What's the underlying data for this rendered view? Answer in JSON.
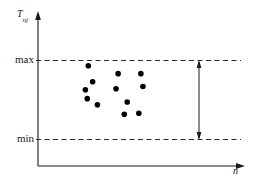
{
  "figure": {
    "background_color": "#ffffff",
    "ink_color": "#1a1a1a",
    "dot_color": "#000000"
  },
  "chart_data": {
    "type": "scatter",
    "title": "",
    "xlabel": "n",
    "ylabel": "T",
    "ylabel_subscript": "nj",
    "grid": false,
    "legend": null,
    "axis_arrows": true,
    "xlim": [
      0,
      1
    ],
    "ylim": [
      0,
      1
    ],
    "tick_labels": {
      "y": [
        "max",
        "min"
      ]
    },
    "reference_lines": [
      {
        "name": "max",
        "label": "max",
        "y": 0.72,
        "style": "dashed"
      },
      {
        "name": "min",
        "label": "min",
        "y": 0.255,
        "style": "dashed"
      }
    ],
    "range_annotation": {
      "name": "range-arrow",
      "label": "",
      "x": 0.8,
      "y_from": 0.255,
      "y_to": 0.72,
      "style": "double-headed-arrow"
    },
    "points": [
      {
        "x": 0.243,
        "y": 0.677
      },
      {
        "x": 0.264,
        "y": 0.569
      },
      {
        "x": 0.229,
        "y": 0.515
      },
      {
        "x": 0.238,
        "y": 0.455
      },
      {
        "x": 0.287,
        "y": 0.414
      },
      {
        "x": 0.387,
        "y": 0.624
      },
      {
        "x": 0.377,
        "y": 0.522
      },
      {
        "x": 0.431,
        "y": 0.432
      },
      {
        "x": 0.417,
        "y": 0.349
      },
      {
        "x": 0.497,
        "y": 0.624
      },
      {
        "x": 0.507,
        "y": 0.537
      },
      {
        "x": 0.487,
        "y": 0.356
      }
    ]
  }
}
